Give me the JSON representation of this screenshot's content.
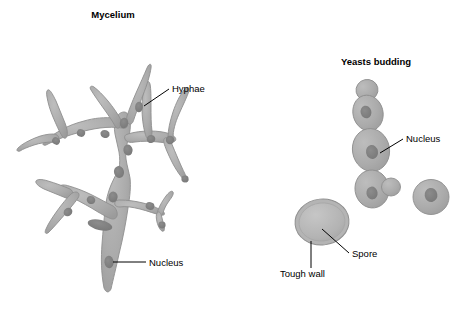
{
  "figure": {
    "background_color": "#ffffff",
    "line_color": "#000000",
    "cytoplasm_color": "#a9a9a9",
    "cytoplasm_edge_color": "#8f8f8f",
    "nucleus_color": "#7d7d7d",
    "wall_color": "#b8b8b8"
  },
  "panels": {
    "mycelium": {
      "title": "Mycelium",
      "title_x": 113,
      "title_y": 18,
      "labels": [
        {
          "id": "hyphae",
          "text": "Hyphae",
          "text_x": 172,
          "text_y": 92,
          "leader": "M144,106 L169,89"
        },
        {
          "id": "nucleus",
          "text": "Nucleus",
          "text_x": 149,
          "text_y": 266,
          "leader": "M113,262 L146,262"
        }
      ]
    },
    "yeasts": {
      "title": "Yeasts budding",
      "title_x": 376,
      "title_y": 65,
      "labels": [
        {
          "id": "nucleus",
          "text": "Nucleus",
          "text_x": 406,
          "text_y": 142,
          "leader": "M380,153 L403,139"
        },
        {
          "id": "spore",
          "text": "Spore",
          "text_x": 352,
          "text_y": 257,
          "leader": "M322,229 L349,253"
        },
        {
          "id": "tough-wall",
          "text": "Tough wall",
          "text_x": 280,
          "text_y": 277,
          "leader": "M311,241 L311,268"
        }
      ]
    }
  }
}
